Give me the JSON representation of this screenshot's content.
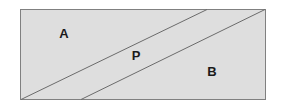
{
  "figure": {
    "title": "",
    "type": "geometry-diagram",
    "background_color": "#ffffff",
    "shape": {
      "name": "rectangle",
      "fill_color": "#dedede",
      "border_color": "#808080",
      "border_width": 1,
      "x": 20,
      "y": 9,
      "width": 246,
      "height": 91
    },
    "lines": [
      {
        "name": "diagonal-line-1",
        "color": "#6b6b6b",
        "width": 1,
        "x1": 21,
        "y1": 100,
        "x2": 207,
        "y2": 9
      },
      {
        "name": "diagonal-line-2",
        "color": "#6b6b6b",
        "width": 1,
        "x1": 81,
        "y1": 100,
        "x2": 265,
        "y2": 9
      }
    ],
    "labels": [
      {
        "text": "A",
        "x": 64,
        "y": 35,
        "color": "#1a1a1a"
      },
      {
        "text": "P",
        "x": 136,
        "y": 57,
        "color": "#1a1a1a"
      },
      {
        "text": "B",
        "x": 212,
        "y": 73,
        "color": "#1a1a1a"
      }
    ]
  }
}
